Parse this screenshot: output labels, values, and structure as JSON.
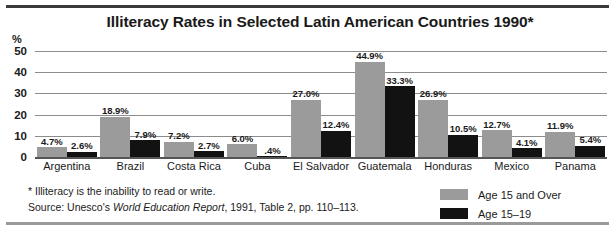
{
  "title": "Illiteracy Rates in Selected Latin American Countries 1990*",
  "axis": {
    "unit_symbol": "%"
  },
  "notes": {
    "footnote": "* Illiteracy is the inability to read or write.",
    "source_prefix": "Source:  Unesco's ",
    "source_italic": "World Education Report",
    "source_suffix": ", 1991, Table 2, pp. 110–113."
  },
  "legend": {
    "items": [
      {
        "label": "Age 15 and Over",
        "color": "#9b9b9b",
        "swatch": "gray-swatch"
      },
      {
        "label": "Age 15–19",
        "color": "#121212",
        "swatch": "black-swatch"
      }
    ]
  },
  "chart_data": {
    "type": "bar",
    "title": "Illiteracy Rates in Selected Latin American Countries 1990*",
    "xlabel": "",
    "ylabel": "%",
    "ylim": [
      0,
      50
    ],
    "yticks": [
      50,
      40,
      30,
      20,
      10,
      0
    ],
    "grid": true,
    "legend_position": "bottom-right",
    "categories": [
      "Argentina",
      "Brazil",
      "Costa Rica",
      "Cuba",
      "El Salvador",
      "Guatemala",
      "Honduras",
      "Mexico",
      "Panama"
    ],
    "series": [
      {
        "name": "Age 15 and Over",
        "color": "#9b9b9b",
        "values": [
          4.7,
          18.9,
          7.2,
          6.0,
          27.0,
          44.9,
          26.9,
          12.7,
          11.9
        ],
        "labels": [
          "4.7%",
          "18.9%",
          "7.2%",
          "6.0%",
          "27.0%",
          "44.9%",
          "26.9%",
          "12.7%",
          "11.9%"
        ]
      },
      {
        "name": "Age 15–19",
        "color": "#121212",
        "values": [
          2.6,
          7.9,
          2.7,
          0.4,
          12.4,
          33.3,
          10.5,
          4.1,
          5.4
        ],
        "labels": [
          "2.6%",
          "7.9%",
          "2.7%",
          ".4%",
          "12.4%",
          "33.3%",
          "10.5%",
          "4.1%",
          "5.4%"
        ]
      }
    ]
  }
}
